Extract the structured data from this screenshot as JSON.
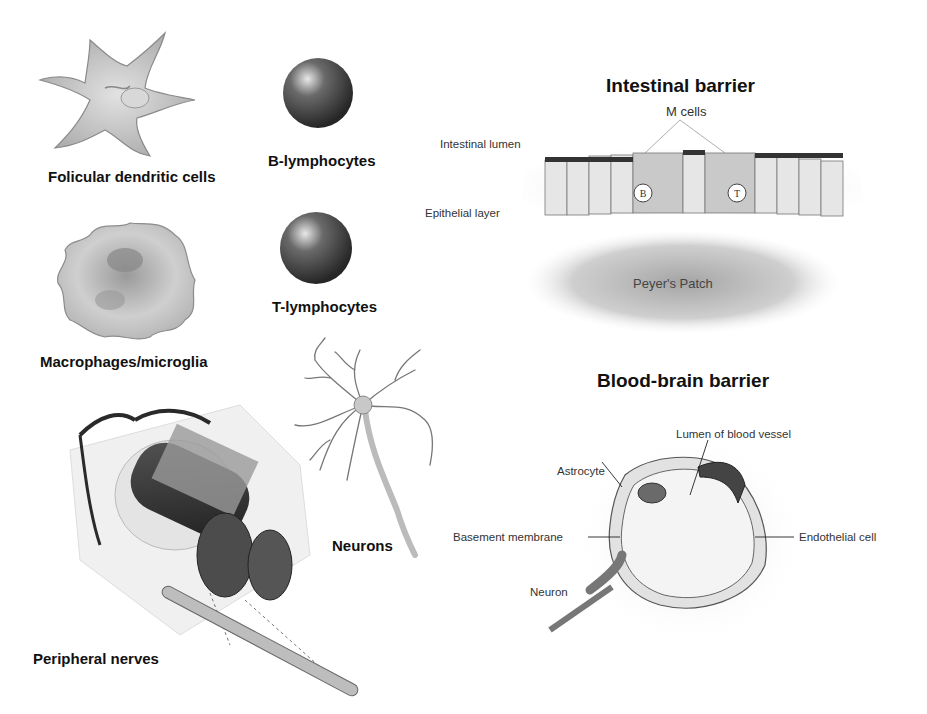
{
  "figure": {
    "left_panel": {
      "cells": [
        {
          "id": "fdc",
          "label": "Folicular dendritic cells"
        },
        {
          "id": "b",
          "label": "B-lymphocytes"
        },
        {
          "id": "macro",
          "label": "Macrophages/microglia"
        },
        {
          "id": "t",
          "label": "T-lymphocytes"
        },
        {
          "id": "neurons",
          "label": "Neurons"
        },
        {
          "id": "nerves",
          "label": "Peripheral nerves"
        }
      ]
    },
    "intestinal": {
      "title": "Intestinal barrier",
      "labels": {
        "m_cells": "M cells",
        "lumen": "Intestinal lumen",
        "epithelial": "Epithelial layer",
        "peyers": "Peyer's Patch",
        "b_marker": "B",
        "t_marker": "T"
      }
    },
    "bbb": {
      "title": "Blood-brain barrier",
      "labels": {
        "lumen": "Lumen of blood vessel",
        "astrocyte": "Astrocyte",
        "basement": "Basement membrane",
        "endothelial": "Endothelial cell",
        "neuron": "Neuron"
      }
    },
    "colors": {
      "cell_fill": "#c8c8c8",
      "cell_dark": "#3a3a3a",
      "text": "#111111"
    }
  }
}
